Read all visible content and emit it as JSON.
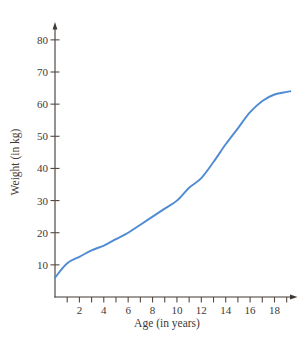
{
  "figure": {
    "background": "#ffffff"
  },
  "chart_data": {
    "type": "line",
    "title": "",
    "xlabel": "Age (in years)",
    "ylabel": "Weight (in kg)",
    "xlim": [
      0,
      19.6
    ],
    "ylim": [
      0,
      84
    ],
    "x_minor_ticks": [
      1,
      2,
      3,
      4,
      5,
      6,
      7,
      8,
      9,
      10,
      11,
      12,
      13,
      14,
      15,
      16,
      17,
      18,
      19
    ],
    "x_labeled_ticks": [
      2,
      4,
      6,
      8,
      10,
      12,
      14,
      16,
      18
    ],
    "y_ticks": [
      10,
      20,
      30,
      40,
      50,
      60,
      70,
      80
    ],
    "grid": false,
    "legend_position": "none",
    "axis_arrows": [
      "x-right",
      "y-top"
    ],
    "axis_color": "#3e3935",
    "tick_color": "#564a42",
    "text_color": "#3e3935",
    "series": [
      {
        "name": "weight-vs-age",
        "color": "#4f8bd2",
        "x": [
          0,
          1,
          2,
          3,
          4,
          5,
          6,
          7,
          8,
          9,
          10,
          11,
          12,
          13,
          14,
          15,
          16,
          17,
          18,
          19,
          19.3
        ],
        "y": [
          6,
          10.5,
          12.5,
          14.5,
          16,
          18,
          20,
          22.5,
          25,
          27.5,
          30,
          34,
          37,
          42,
          47.5,
          52.5,
          57.5,
          61,
          63,
          63.8,
          64
        ]
      }
    ]
  }
}
